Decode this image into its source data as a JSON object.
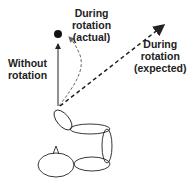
{
  "labels": {
    "actual_line1": "During",
    "actual_line2": "rotation",
    "actual_line3": "(actual)",
    "expected_line1": "During",
    "expected_line2": "rotation",
    "expected_line3": "(expected)",
    "without_line1": "Without",
    "without_line2": "rotation"
  },
  "colors": {
    "stroke": "#222222",
    "dashed_gray": "#777777"
  }
}
